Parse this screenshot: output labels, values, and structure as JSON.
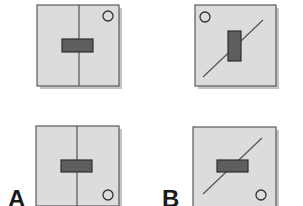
{
  "figure": {
    "labels": {
      "a": "A",
      "b": "B"
    },
    "colors": {
      "background": "#ffffff",
      "panel_fill": "#dcdcdc",
      "panel_border": "#5a5a5a",
      "panel_shadow": "#c4c4c4",
      "block_fill": "#5e5e5e",
      "block_border": "#2e2e2e",
      "axis_line": "#555555",
      "circle_stroke": "#333333"
    },
    "panels": [
      {
        "id": "A-top",
        "column": "A",
        "row": "top",
        "axis": "vertical",
        "block_orientation": "horizontal",
        "circle_position": "top-right"
      },
      {
        "id": "B-top",
        "column": "B",
        "row": "top",
        "axis": "diagonal",
        "block_orientation": "vertical",
        "circle_position": "top-left"
      },
      {
        "id": "A-bottom",
        "column": "A",
        "row": "bottom",
        "axis": "vertical",
        "block_orientation": "horizontal",
        "circle_position": "bottom-right"
      },
      {
        "id": "B-bottom",
        "column": "B",
        "row": "bottom",
        "axis": "diagonal",
        "block_orientation": "horizontal",
        "circle_position": "bottom-right"
      }
    ]
  }
}
